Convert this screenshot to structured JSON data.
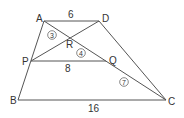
{
  "diagram": {
    "type": "geometry-trapezoid",
    "points": {
      "A": {
        "label": "A",
        "x": 44,
        "y": 21,
        "lx": 36,
        "ly": 22
      },
      "D": {
        "label": "D",
        "x": 99,
        "y": 21,
        "lx": 102,
        "ly": 22
      },
      "P": {
        "label": "P",
        "x": 31,
        "y": 61,
        "lx": 22,
        "ly": 65
      },
      "Q": {
        "label": "Q",
        "x": 106,
        "y": 61,
        "lx": 109,
        "ly": 64
      },
      "R": {
        "label": "R",
        "x": 70,
        "y": 39,
        "lx": 66,
        "ly": 48
      },
      "B": {
        "label": "B",
        "x": 18,
        "y": 100,
        "lx": 10,
        "ly": 104
      },
      "C": {
        "label": "C",
        "x": 166,
        "y": 100,
        "lx": 168,
        "ly": 105
      }
    },
    "segments": [
      {
        "name": "AD",
        "from": "A",
        "to": "D"
      },
      {
        "name": "AB",
        "from": "A",
        "to": "B"
      },
      {
        "name": "DC",
        "from": "D",
        "to": "C"
      },
      {
        "name": "BC",
        "from": "B",
        "to": "C"
      },
      {
        "name": "PQ",
        "from": "P",
        "to": "Q"
      },
      {
        "name": "AC",
        "from": "A",
        "to": "C"
      },
      {
        "name": "PD",
        "from": "P",
        "to": "D"
      }
    ],
    "lengths": [
      {
        "segment": "AD",
        "value": "6",
        "x": 68,
        "y": 18
      },
      {
        "segment": "PQ",
        "value": "8",
        "x": 65,
        "y": 72
      },
      {
        "segment": "BC",
        "value": "16",
        "x": 88,
        "y": 112
      }
    ],
    "ratios": [
      {
        "segment": "AR",
        "value": "3",
        "x": 52,
        "y": 35
      },
      {
        "segment": "RQ",
        "value": "4",
        "x": 81,
        "y": 53
      },
      {
        "segment": "QC",
        "value": "7",
        "x": 124,
        "y": 82
      }
    ]
  }
}
